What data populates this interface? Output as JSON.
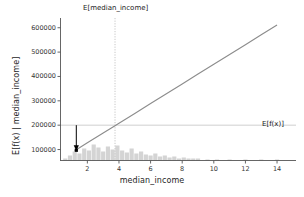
{
  "chart_data": {
    "type": "line",
    "title": "",
    "subtitle": "",
    "xlabel": "median_income",
    "ylabel": "E[f(x) | median_income]",
    "xlim": [
      0.3,
      15.2
    ],
    "ylim": [
      55000,
      640000
    ],
    "xticks": [
      2,
      4,
      6,
      8,
      10,
      12,
      14
    ],
    "xticklabels": [
      "2",
      "4",
      "6",
      "8",
      "10",
      "12",
      "14"
    ],
    "yticks": [
      100000,
      200000,
      300000,
      400000,
      500000,
      600000
    ],
    "yticklabels": [
      "100000",
      "200000",
      "300000",
      "400000",
      "500000",
      "600000"
    ],
    "grid": false,
    "legend": null,
    "series": [
      {
        "name": "partial_dependence",
        "type": "line",
        "color": "#8c8c8c",
        "linewidth": 1.1,
        "x": [
          1.2,
          2.0,
          3.0,
          3.75,
          4.0,
          5.0,
          6.0,
          7.0,
          8.0,
          9.0,
          10.0,
          11.0,
          12.0,
          13.0,
          14.0
        ],
        "y": [
          95000,
          128000,
          168000,
          198000,
          208000,
          248000,
          289000,
          329000,
          369000,
          410000,
          450000,
          490000,
          530000,
          571000,
          611000
        ]
      },
      {
        "name": "feature_histogram",
        "type": "bar",
        "color": "#d4d4d4",
        "note": "rug / distribution of median_income along bottom axis",
        "x": [
          0.6,
          0.9,
          1.2,
          1.5,
          1.8,
          2.1,
          2.4,
          2.7,
          3.0,
          3.3,
          3.6,
          3.9,
          4.2,
          4.5,
          4.8,
          5.1,
          5.4,
          5.7,
          6.0,
          6.3,
          6.6,
          6.9,
          7.2,
          7.5,
          7.8,
          8.1,
          8.4,
          8.7,
          9.0,
          9.6,
          10.2,
          11.0,
          12.0,
          13.0,
          14.0
        ],
        "values": [
          2,
          5,
          9,
          7,
          12,
          10,
          16,
          13,
          9,
          14,
          11,
          15,
          10,
          8,
          12,
          7,
          9,
          6,
          5,
          7,
          4,
          5,
          3,
          4,
          2,
          3,
          2,
          2,
          2,
          1,
          1,
          1,
          1,
          1,
          1
        ]
      }
    ],
    "reference_lines": [
      {
        "name": "expected-feature-value",
        "orientation": "vertical",
        "value": 3.75,
        "style": "dotted",
        "color": "#bfbfbf",
        "label": "E[median_income]",
        "label_position": "top"
      },
      {
        "name": "expected-prediction",
        "orientation": "horizontal",
        "value": 200000,
        "style": "solid",
        "color": "#c9c9c9",
        "label": "E[f(x)]",
        "label_position": "right"
      }
    ],
    "annotations": [
      {
        "name": "arrow-marker",
        "type": "arrow",
        "x": 1.3,
        "y_start": 200000,
        "y_end": 97000,
        "color": "#000000",
        "marker": "point"
      }
    ]
  },
  "annotations_text": {
    "top_label": "E[median_income]",
    "right_label": "E[f(x)]"
  },
  "colors": {
    "background": "#ffffff",
    "line": "#8c8c8c",
    "hist": "#d4d4d4",
    "axis": "#4d4d4d",
    "text": "#262626",
    "gridline_h": "#c9c9c9",
    "gridline_v": "#bfbfbf",
    "arrow": "#000000"
  }
}
